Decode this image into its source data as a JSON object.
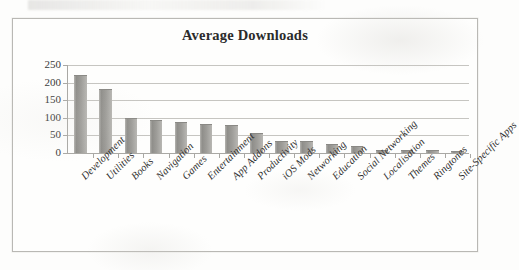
{
  "chart_data": {
    "type": "bar",
    "title": "Average Downloads",
    "xlabel": "",
    "ylabel": "",
    "ylim": [
      0,
      250
    ],
    "yticks": [
      0,
      50,
      100,
      150,
      200,
      250
    ],
    "ytick_labels": [
      "0",
      "50",
      "100",
      "150",
      "200",
      "250"
    ],
    "grid": true,
    "legend": "none",
    "orientation": "vertical",
    "categories": [
      "Development",
      "Utilities",
      "Books",
      "Navigation",
      "Games",
      "Entertainment",
      "App Addons",
      "Productivity",
      "iOS Mods",
      "Networking",
      "Education",
      "Social Networking",
      "Localisation",
      "Themes",
      "Ringtones",
      "Site-Specific Apps"
    ],
    "values": [
      218,
      180,
      98,
      92,
      84,
      79,
      78,
      54,
      31,
      30,
      22,
      18,
      7,
      5,
      5,
      4
    ],
    "series": [
      {
        "name": "Average Downloads",
        "values": [
          218,
          180,
          98,
          92,
          84,
          79,
          78,
          54,
          31,
          30,
          22,
          18,
          7,
          5,
          5,
          4
        ]
      }
    ],
    "bar_color": "#9e9d99",
    "gridline_color": "#c6c5c1",
    "axis_color": "#a9a8a4",
    "text_color": "#2e2e2e"
  }
}
